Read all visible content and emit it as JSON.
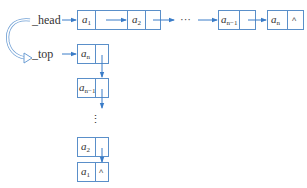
{
  "diagram": {
    "type": "linked-list-reversal",
    "colors": {
      "node_border": "#5a8fc9",
      "arrow": "#3a7cc8",
      "text": "#333333"
    },
    "pointers": {
      "head": {
        "label": "_head"
      },
      "top": {
        "label": "_top"
      },
      "transition_icon": "curved-arrow-icon"
    },
    "head_list": {
      "nodes": [
        {
          "base": "a",
          "sub": "1",
          "next": "pointer"
        },
        {
          "base": "a",
          "sub": "2",
          "next": "pointer"
        },
        {
          "ellipsis": "···"
        },
        {
          "base": "a",
          "sub": "n−1",
          "next": "pointer"
        },
        {
          "base": "a",
          "sub": "n",
          "next": "^"
        }
      ]
    },
    "top_list": {
      "nodes": [
        {
          "base": "a",
          "sub": "n",
          "next": "pointer"
        },
        {
          "base": "a",
          "sub": "n−1",
          "next": "pointer"
        },
        {
          "ellipsis": "⋮"
        },
        {
          "base": "a",
          "sub": "2",
          "next": "pointer"
        },
        {
          "base": "a",
          "sub": "1",
          "next": "^"
        }
      ]
    }
  }
}
